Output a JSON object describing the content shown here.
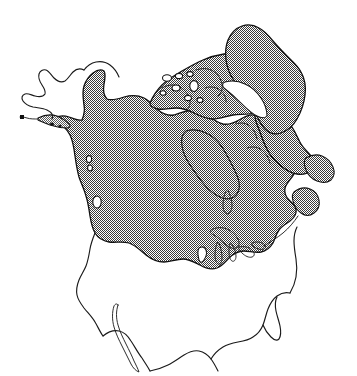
{
  "figure": {
    "subject": "North America",
    "style": "line-art outline map with stippled shading",
    "background_color": "#ffffff",
    "line_color": "#1a1a1a",
    "shading_fill_color": "#808080",
    "shading_pattern": "fine checkerboard dither / stipple",
    "width_px": 357,
    "height_px": 376,
    "has_labels": false,
    "has_legend": false,
    "has_axes": false,
    "has_scale_bar": false,
    "has_border": false
  },
  "regions": {
    "shaded": {
      "name": "ice-covered region",
      "description": "stippled gray area covering Canada, Greenland, the Canadian Arctic Archipelago, southern Alaska and the northern United States",
      "members": [
        "Greenland",
        "Canadian Arctic Archipelago",
        "Hudson Bay",
        "Canada mainland",
        "southern Alaska coast",
        "Newfoundland",
        "northern United States"
      ]
    },
    "unshaded": {
      "name": "ice-free region",
      "description": "white outline-only area covering western Alaska, the contiguous United States, Mexico and Baja California",
      "members": [
        "western Alaska (Beringia)",
        "contiguous United States",
        "Mexico",
        "Baja California",
        "Florida"
      ]
    }
  },
  "features": [
    {
      "id": "greenland",
      "label": "Greenland",
      "shaded": true
    },
    {
      "id": "arctic-archipelago",
      "label": "Canadian Arctic Archipelago",
      "shaded": true
    },
    {
      "id": "hudson-bay",
      "label": "Hudson Bay",
      "shaded": true
    },
    {
      "id": "baffin-bay",
      "label": "Baffin Bay / Davis Strait",
      "shaded": false
    },
    {
      "id": "alaska",
      "label": "Alaska",
      "shaded": false
    },
    {
      "id": "aleutian-chain",
      "label": "Alaska Peninsula / Aleutian chain",
      "shaded": true
    },
    {
      "id": "pacific-coast-islands",
      "label": "Pacific coast islands",
      "shaded": true
    },
    {
      "id": "newfoundland",
      "label": "Newfoundland",
      "shaded": true
    },
    {
      "id": "great-lakes",
      "label": "Great Lakes",
      "shaded": true
    },
    {
      "id": "united-states",
      "label": "United States",
      "shaded": false
    },
    {
      "id": "baja-california",
      "label": "Baja California",
      "shaded": false
    },
    {
      "id": "florida",
      "label": "Florida",
      "shaded": false
    },
    {
      "id": "gulf-of-mexico",
      "label": "Gulf of Mexico",
      "shaded": false
    }
  ],
  "accessible_text": "Black and white outline map of North America. A fine stippled gray fill covers Greenland, the Canadian Arctic Archipelago, Hudson Bay, all of mainland Canada, the southern Alaskan coast and Aleutian chain, Newfoundland, and the northern fringe of the United States, marking the extent of the glacial ice sheet. Western Alaska, the contiguous United States, Baja California, Florida, and Mexico are left white."
}
